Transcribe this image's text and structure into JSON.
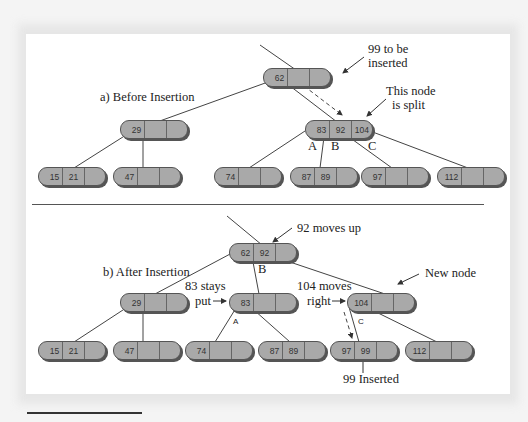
{
  "figure": {
    "title_before": "a) Before Insertion",
    "title_after": "b) After Insertion",
    "colors": {
      "node_fill": "#a8a8a8",
      "node_shadow": "#555555",
      "line": "#444444",
      "panel": "#ffffff",
      "background": "#f4f4f4"
    }
  },
  "before": {
    "annotations": {
      "to_insert_1": "99 to be",
      "to_insert_2": "inserted",
      "split_1": "This node",
      "split_2": "is split",
      "A": "A",
      "B": "B",
      "C": "C"
    },
    "nodes": [
      {
        "id": "root",
        "keys": [
          "62",
          "",
          ""
        ]
      },
      {
        "id": "left",
        "keys": [
          "29",
          "",
          ""
        ]
      },
      {
        "id": "right",
        "keys": [
          "83",
          "92",
          "104"
        ]
      },
      {
        "id": "leaf1",
        "keys": [
          "15",
          "21",
          ""
        ]
      },
      {
        "id": "leaf2",
        "keys": [
          "47",
          "",
          ""
        ]
      },
      {
        "id": "leaf3",
        "keys": [
          "74",
          "",
          ""
        ]
      },
      {
        "id": "leaf4",
        "keys": [
          "87",
          "89",
          ""
        ]
      },
      {
        "id": "leaf5",
        "keys": [
          "97",
          "",
          ""
        ]
      },
      {
        "id": "leaf6",
        "keys": [
          "112",
          "",
          ""
        ]
      }
    ]
  },
  "after": {
    "annotations": {
      "moves_up": "92 moves up",
      "stays_1": "83 stays",
      "stays_2": "put",
      "moves_right_1": "104 moves",
      "moves_right_2": "right",
      "new_node": "New node",
      "inserted": "99 Inserted",
      "A": "A",
      "B": "B",
      "C": "C"
    },
    "nodes": [
      {
        "id": "root",
        "keys": [
          "62",
          "92",
          ""
        ]
      },
      {
        "id": "n29",
        "keys": [
          "29",
          "",
          ""
        ]
      },
      {
        "id": "n83",
        "keys": [
          "83",
          "",
          ""
        ]
      },
      {
        "id": "n104",
        "keys": [
          "104",
          "",
          ""
        ]
      },
      {
        "id": "leaf1",
        "keys": [
          "15",
          "21",
          ""
        ]
      },
      {
        "id": "leaf2",
        "keys": [
          "47",
          "",
          ""
        ]
      },
      {
        "id": "leaf3",
        "keys": [
          "74",
          "",
          ""
        ]
      },
      {
        "id": "leaf4",
        "keys": [
          "87",
          "89",
          ""
        ]
      },
      {
        "id": "leaf5",
        "keys": [
          "97",
          "99",
          ""
        ]
      },
      {
        "id": "leaf6",
        "keys": [
          "112",
          "",
          ""
        ]
      }
    ]
  }
}
